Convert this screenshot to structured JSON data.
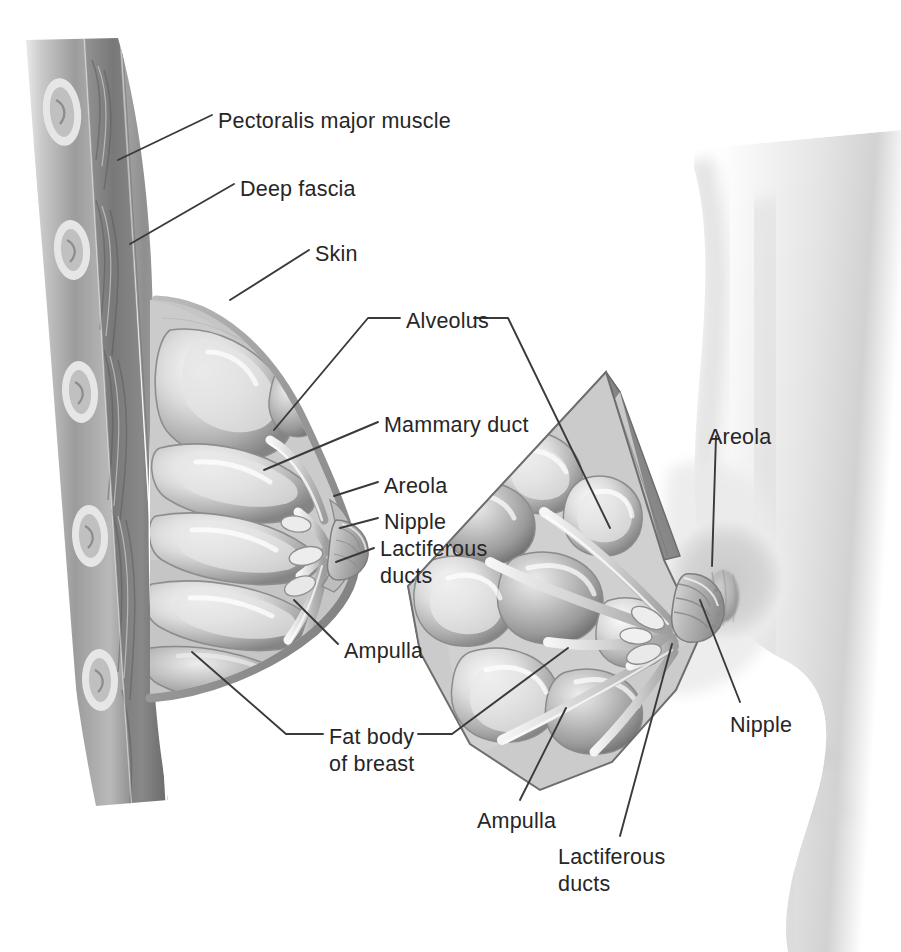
{
  "figure": {
    "background_color": "#ffffff",
    "label_color": "#262626",
    "leader_line_color": "#3a3a3a"
  },
  "labels": [
    {
      "id": "pectoralis-major-muscle",
      "text": "Pectoralis major muscle",
      "x": 218,
      "y": 108,
      "lines": 1
    },
    {
      "id": "deep-fascia",
      "text": "Deep fascia",
      "x": 240,
      "y": 176,
      "lines": 1
    },
    {
      "id": "skin",
      "text": "Skin",
      "x": 315,
      "y": 241,
      "lines": 1
    },
    {
      "id": "alveolus",
      "text": "Alveolus",
      "x": 406,
      "y": 308,
      "lines": 1
    },
    {
      "id": "mammary-duct",
      "text": "Mammary duct",
      "x": 384,
      "y": 412,
      "lines": 1
    },
    {
      "id": "areola-left",
      "text": "Areola",
      "x": 384,
      "y": 473,
      "lines": 1
    },
    {
      "id": "nipple-left",
      "text": "Nipple",
      "x": 384,
      "y": 509,
      "lines": 1
    },
    {
      "id": "lactiferous-ducts-left",
      "text": "Lactiferous\nducts",
      "x": 380,
      "y": 536,
      "lines": 2
    },
    {
      "id": "ampulla-left",
      "text": "Ampulla",
      "x": 344,
      "y": 638,
      "lines": 1
    },
    {
      "id": "fat-body-of-breast",
      "text": "Fat body\nof breast",
      "x": 329,
      "y": 724,
      "lines": 2
    },
    {
      "id": "areola-right",
      "text": "Areola",
      "x": 708,
      "y": 424,
      "lines": 1
    },
    {
      "id": "nipple-right",
      "text": "Nipple",
      "x": 730,
      "y": 712,
      "lines": 1
    },
    {
      "id": "ampulla-bottom",
      "text": "Ampulla",
      "x": 477,
      "y": 808,
      "lines": 1
    },
    {
      "id": "lactiferous-ducts-bottom",
      "text": "Lactiferous\nducts",
      "x": 558,
      "y": 844,
      "lines": 2
    }
  ],
  "views": [
    {
      "id": "sagittal-section",
      "name": "Sagittal section of breast and chest wall"
    },
    {
      "id": "wedge-cutaway",
      "name": "Anterior wedge cutaway of breast"
    },
    {
      "id": "body-profile",
      "name": "Lateral body profile silhouette"
    }
  ],
  "structures": [
    "rib",
    "intercostal muscle",
    "pectoralis major muscle",
    "deep fascia",
    "skin",
    "fat body of breast",
    "glandular lobule",
    "alveolus",
    "mammary duct",
    "lactiferous duct",
    "ampulla",
    "areola",
    "nipple"
  ]
}
